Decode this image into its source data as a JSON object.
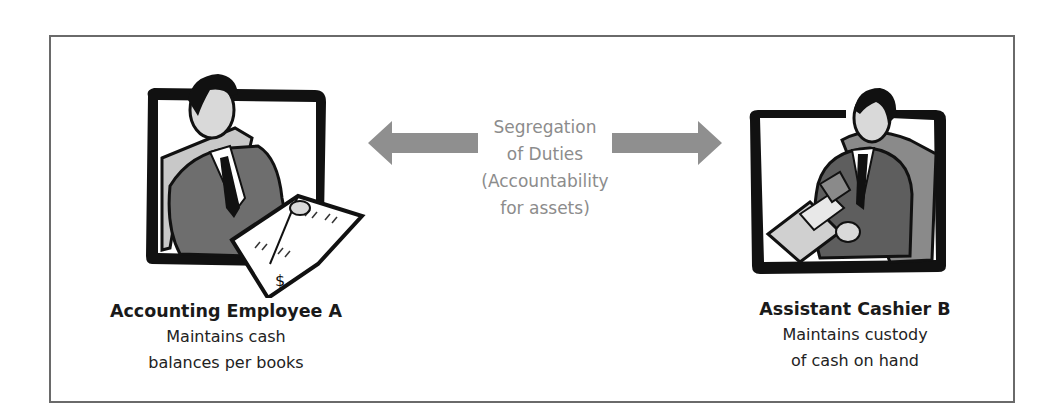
{
  "diagram": {
    "type": "segregation-of-duties-illustration",
    "center": {
      "lines": [
        "Segregation",
        "of Duties",
        "(Accountability",
        "for assets)"
      ],
      "color": "#8c8c8c"
    },
    "arrows": {
      "left": {
        "direction": "left",
        "color": "#8f8f8f"
      },
      "right": {
        "direction": "right",
        "color": "#8f8f8f"
      }
    },
    "roles": [
      {
        "title": "Accounting Employee A",
        "description_lines": [
          "Maintains cash",
          "balances per books"
        ],
        "icon": "accountant-reading-ledger-icon"
      },
      {
        "title": "Assistant Cashier B",
        "description_lines": [
          "Maintains custody",
          "of cash on hand"
        ],
        "icon": "cashier-handling-cash-icon"
      }
    ],
    "frame_color": "#6a6a6a"
  }
}
